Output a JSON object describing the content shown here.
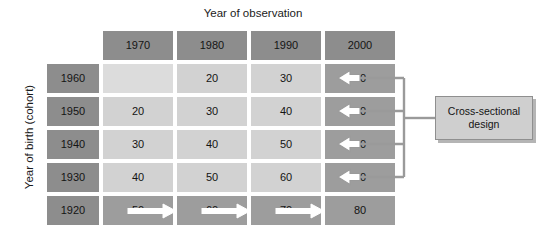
{
  "figure": {
    "column_axis_title": "Year of observation",
    "row_axis_title": "Year of birth (cohort)"
  },
  "table": {
    "column_headers": [
      "1970",
      "1980",
      "1990",
      "2000"
    ],
    "row_headers": [
      "1960",
      "1950",
      "1940",
      "1930",
      "1920"
    ],
    "rows": [
      {
        "cohort": "1960",
        "values": [
          "",
          "20",
          "30",
          "40"
        ]
      },
      {
        "cohort": "1950",
        "values": [
          "20",
          "30",
          "40",
          "50"
        ]
      },
      {
        "cohort": "1940",
        "values": [
          "30",
          "40",
          "50",
          "60"
        ]
      },
      {
        "cohort": "1930",
        "values": [
          "40",
          "50",
          "60",
          "70"
        ]
      },
      {
        "cohort": "1920",
        "values": [
          "50",
          "60",
          "70",
          "80"
        ]
      }
    ]
  },
  "callout": {
    "line1": "Cross-sectional",
    "line2": "design"
  },
  "colors": {
    "header_gray": "#8d8d8d",
    "cell_light": "#d2d2d2",
    "cell_empty": "#dcdcdc",
    "cell_highlight": "#9d9d9d",
    "callout_fill": "#cfcfcf",
    "connector": "#9a9a9a",
    "arrow_fill": "#ffffff",
    "text": "#141414",
    "background": "#ffffff"
  },
  "annotations": {
    "cross_sectional_arrows": [
      "40",
      "50",
      "60",
      "70"
    ],
    "longitudinal_arrows": [
      "50",
      "60",
      "70",
      "80"
    ]
  }
}
